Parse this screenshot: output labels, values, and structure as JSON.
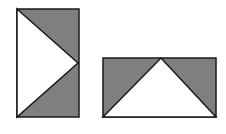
{
  "figure": {
    "colors": {
      "fill_gray": "#7f7f7f",
      "fill_white": "#ffffff",
      "stroke": "#1a1a1a"
    },
    "shapes": [
      {
        "name": "left-rectangle",
        "rect": {
          "x": 17,
          "y": 9,
          "w": 62,
          "h": 108
        },
        "white_triangle": [
          [
            17,
            9
          ],
          [
            78,
            63
          ],
          [
            17,
            117
          ]
        ]
      },
      {
        "name": "right-rectangle",
        "rect": {
          "x": 103,
          "y": 58,
          "w": 113,
          "h": 59
        },
        "white_triangle": [
          [
            103,
            117
          ],
          [
            161,
            58
          ],
          [
            216,
            117
          ]
        ]
      }
    ]
  }
}
